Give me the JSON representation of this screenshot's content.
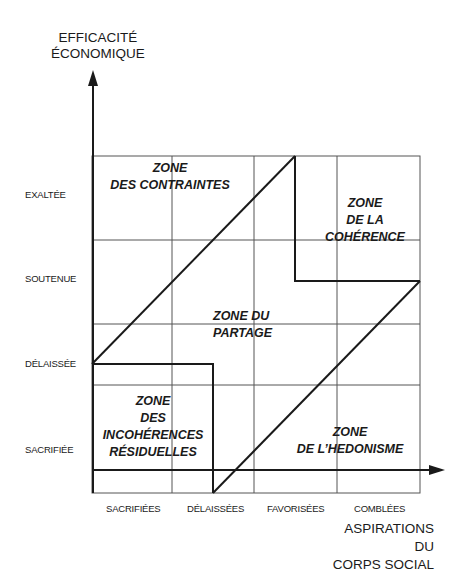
{
  "diagram": {
    "y_axis": {
      "title_line1": "EFFICACITÉ",
      "title_line2": "ÉCONOMIQUE",
      "ticks": [
        "EXALTÉE",
        "SOUTENUE",
        "DÉLAISSÉE",
        "SACRIFIÉE"
      ]
    },
    "x_axis": {
      "title_line1": "ASPIRATIONS",
      "title_line2": "DU",
      "title_line3": "CORPS SOCIAL",
      "ticks": [
        "SACRIFIÉES",
        "DÉLAISSÉES",
        "FAVORISÉES",
        "COMBLÉES"
      ]
    },
    "zones": {
      "contraintes": {
        "line1": "ZONE",
        "line2": "DES CONTRAINTES"
      },
      "coherence": {
        "line1": "ZONE",
        "line2": "DE LA",
        "line3": "COHÉRENCE"
      },
      "partage": {
        "line1": "ZONE DU",
        "line2": "PARTAGE"
      },
      "incoherences": {
        "line1": "ZONE",
        "line2": "DES",
        "line3": "INCOHÉRENCES",
        "line4": "RÉSIDUELLES"
      },
      "hedonisme": {
        "line1": "ZONE",
        "line2": "DE L’HEDONISME"
      }
    },
    "colors": {
      "line": "#1a1a1a",
      "grid": "#555555",
      "background": "#ffffff"
    }
  }
}
